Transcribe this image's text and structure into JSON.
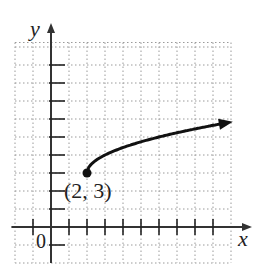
{
  "chart_data": {
    "type": "line",
    "title": "",
    "xlabel": "x",
    "ylabel": "y",
    "origin_label": "0",
    "function": "y = sqrt(x - 2) + 3",
    "domain": [
      2,
      10.2
    ],
    "xlim": [
      -2,
      10
    ],
    "ylim": [
      -2,
      11
    ],
    "grid": true,
    "x_ticks": [
      -1,
      1,
      2,
      3,
      4,
      5,
      6,
      7,
      8,
      9
    ],
    "y_ticks": [
      -1,
      1,
      2,
      3,
      4,
      5,
      6,
      7,
      8,
      9
    ],
    "start_point": {
      "x": 2,
      "y": 3,
      "label": "(2, 3)",
      "filled": true
    },
    "end_arrow": true,
    "x": [
      2,
      3,
      4,
      5,
      6,
      7,
      8,
      9,
      10
    ],
    "series": [
      {
        "name": "f(x)",
        "values": [
          3,
          4,
          4.41,
          4.73,
          5,
          5.24,
          5.45,
          5.65,
          5.83
        ]
      }
    ],
    "colors": {
      "curve": "#111111",
      "axis": "#333333",
      "grid": "#9a9a9a"
    }
  },
  "labels": {
    "x_axis": "x",
    "y_axis": "y",
    "origin": "0",
    "point": "(2, 3)"
  }
}
